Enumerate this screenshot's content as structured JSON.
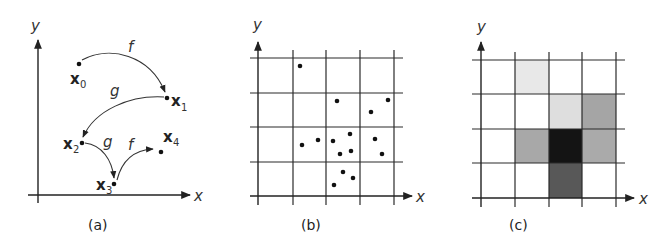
{
  "panels": {
    "a": {
      "caption": "(a)",
      "x_axis_label": "x",
      "y_axis_label": "y",
      "points": [
        {
          "name": "x",
          "sub": "0",
          "cx": 79,
          "cy": 64
        },
        {
          "name": "x",
          "sub": "1",
          "cx": 167,
          "cy": 98
        },
        {
          "name": "x",
          "sub": "2",
          "cx": 82,
          "cy": 143
        },
        {
          "name": "x",
          "sub": "3",
          "cx": 114,
          "cy": 184
        },
        {
          "name": "x",
          "sub": "4",
          "cx": 161,
          "cy": 152
        }
      ],
      "maps": [
        {
          "label": "f",
          "from": "x0",
          "to": "x1"
        },
        {
          "label": "g",
          "from": "x1",
          "to": "x2"
        },
        {
          "label": "g",
          "from": "x2",
          "to": "x3"
        },
        {
          "label": "f",
          "from": "x3",
          "to": "x4"
        }
      ]
    },
    "b": {
      "caption": "(b)",
      "x_axis_label": "x",
      "y_axis_label": "y",
      "grid": {
        "cols": 4,
        "rows": 4
      },
      "point_count": 15
    },
    "c": {
      "caption": "(c)",
      "x_axis_label": "x",
      "y_axis_label": "y",
      "grid": {
        "cols": 4,
        "rows": 4
      },
      "shaded_cells": [
        {
          "row": 0,
          "col": 1,
          "color": "#e8e8e8"
        },
        {
          "row": 1,
          "col": 2,
          "color": "#dedede"
        },
        {
          "row": 1,
          "col": 3,
          "color": "#a5a5a5"
        },
        {
          "row": 2,
          "col": 1,
          "color": "#a8a8a8"
        },
        {
          "row": 2,
          "col": 2,
          "color": "#141414"
        },
        {
          "row": 2,
          "col": 3,
          "color": "#aaaaaa"
        },
        {
          "row": 3,
          "col": 2,
          "color": "#585858"
        }
      ]
    }
  }
}
